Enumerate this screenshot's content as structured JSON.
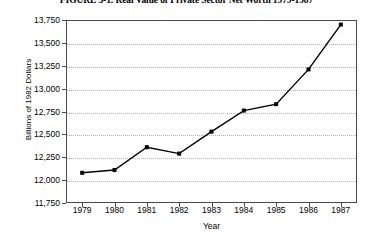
{
  "chart_data": {
    "type": "line",
    "title": "FIGURE 5-1.  Real Value of Private Sector Net Worth 1979-1987",
    "xlabel": "Year",
    "ylabel": "Billions of 1982 Dollars",
    "categories": [
      "1979",
      "1980",
      "1981",
      "1982",
      "1983",
      "1984",
      "1985",
      "1986",
      "1987"
    ],
    "values": [
      12080,
      12110,
      12360,
      12290,
      12530,
      12760,
      12830,
      13210,
      13700
    ],
    "series": [
      {
        "name": "Real Value of Private Sector Net Worth",
        "values": [
          12080,
          12110,
          12360,
          12290,
          12530,
          12760,
          12830,
          13210,
          13700
        ]
      }
    ],
    "ylim": [
      11750,
      13750
    ],
    "yticks": [
      11750,
      12000,
      12250,
      12500,
      12750,
      13000,
      13250,
      13500,
      13750
    ],
    "ytick_labels": [
      "11,750",
      "12,000",
      "12,250",
      "12,500",
      "12,750",
      "13,000",
      "13,250",
      "13,500",
      "13,750"
    ],
    "grid": "horizontal-dotted",
    "legend": "none",
    "line_color": "#000000",
    "marker": "square",
    "marker_color": "#000000",
    "frame_color": "#4a4a4a",
    "gridline_color": "#b0b0b0",
    "background": "#ffffff"
  }
}
